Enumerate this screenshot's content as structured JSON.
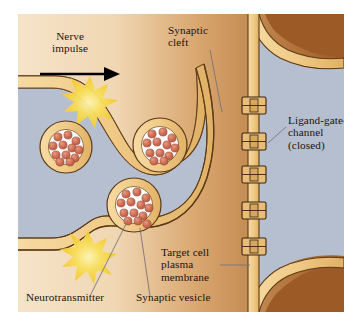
{
  "figure": {
    "type": "biology-diagram"
  },
  "labels": {
    "nerve_impulse": "Nerve\nimpulse",
    "synaptic_cleft": "Synaptic\ncleft",
    "ligand_gated_channel": "Ligand-gated\nchannel\n(closed)",
    "target_cell_membrane": "Target cell\nplasma\nmembrane",
    "neurotransmitter": "Neurotransmitter",
    "synaptic_vesicle": "Synaptic vesicle"
  },
  "colors": {
    "background_left": "#f3ddbe",
    "background_cleft": "#c08a52",
    "background_dark": "#9c5a27",
    "membrane_fill": "#f2cf8f",
    "membrane_stroke": "#5d3a17",
    "cytoplasm": "#b6bfcf",
    "vesicle_ring": "#f2cf8f",
    "vesicle_interior": "#ffffff",
    "neurotransmitter_dot": "#cc6a52",
    "impulse_flash": "#f7d84a",
    "arrow": "#000000",
    "leader_line": "#6b6b70",
    "text": "#1a1410"
  },
  "elements": {
    "vesicles": [
      {
        "name": "vesicle-left",
        "cx": 50,
        "cy": 133,
        "r": 25,
        "dots": 12
      },
      {
        "name": "vesicle-upper-right",
        "cx": 143,
        "cy": 133,
        "r": 26,
        "dots": 12
      },
      {
        "name": "vesicle-fusing",
        "cx": 117,
        "cy": 192,
        "r": 26,
        "dots": 13
      }
    ],
    "channels": [
      {
        "name": "channel-1",
        "y": 92
      },
      {
        "name": "channel-2",
        "y": 128
      },
      {
        "name": "channel-3",
        "y": 160
      },
      {
        "name": "channel-4",
        "y": 196
      },
      {
        "name": "channel-5",
        "y": 232
      }
    ],
    "impulse_flashes": [
      {
        "name": "flash-upper",
        "cx": 72,
        "cy": 88
      },
      {
        "name": "flash-lower",
        "cx": 72,
        "cy": 243
      }
    ],
    "arrow": {
      "name": "nerve-impulse-arrow",
      "x1": 24,
      "y1": 60,
      "x2": 95,
      "y2": 60
    }
  }
}
